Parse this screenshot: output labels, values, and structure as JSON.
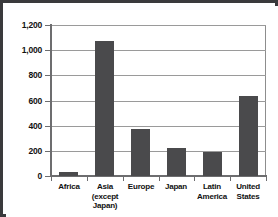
{
  "chart_data": {
    "type": "bar",
    "title": "",
    "subtitle": "",
    "xlabel": "",
    "ylabel": "",
    "categories": [
      "Africa",
      "Asia (except Japan)",
      "Europe",
      "Japan",
      "Latin America",
      "United States"
    ],
    "category_lines": [
      [
        "Africa"
      ],
      [
        "Asia",
        "(except",
        "Japan)"
      ],
      [
        "Europe"
      ],
      [
        "Japan"
      ],
      [
        "Latin",
        "America"
      ],
      [
        "United",
        "States"
      ]
    ],
    "values": [
      35,
      1070,
      370,
      225,
      190,
      635
    ],
    "ylim": [
      0,
      1200
    ],
    "ytick_values": [
      0,
      200,
      400,
      600,
      800,
      1000,
      1200
    ],
    "ytick_labels": [
      "0",
      "200",
      "400",
      "600",
      "800",
      "1,000",
      "1,200"
    ],
    "grid": "horizontal",
    "legend": "none",
    "bar_color": "#4a4a4c",
    "axis_color": "#6d6d6f",
    "grid_color": "#9a9a9a",
    "frame_color": "#3a3a3c",
    "background_color": "#ffffff"
  }
}
